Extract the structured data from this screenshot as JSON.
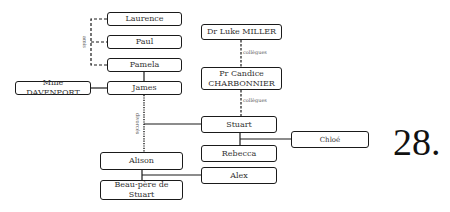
{
  "nodes": {
    "laurence": "Laurence",
    "paul": "Paul",
    "pamela": "Pamela",
    "james": "James",
    "mme_davenport": "Mme DAVENPORT",
    "dr_luke_miller": "Dr Luke MILLER",
    "pr_candice": "Pr Candice CHARBONNIER",
    "stuart": "Stuart",
    "rebecca": "Rebecca",
    "alex": "Alex",
    "alison": "Alison",
    "beau_pere": "Beau-père de Stuart",
    "chloe": "Chloé"
  },
  "edge_labels": {
    "amis": "amis",
    "collegues_1": "collègues",
    "collegues_2": "collègues",
    "divorces": "divorcés"
  },
  "page_number": "28."
}
